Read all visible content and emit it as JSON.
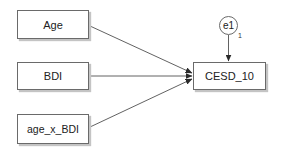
{
  "diagram": {
    "type": "path-diagram",
    "observed_variables": {
      "age": {
        "label": "Age"
      },
      "bdi": {
        "label": "BDI"
      },
      "age_x_bdi": {
        "label": "age_x_BDI"
      },
      "cesd": {
        "label": "CESD_10"
      }
    },
    "error_terms": {
      "e1": {
        "label": "e1",
        "weight": "1"
      }
    },
    "paths": [
      {
        "from": "Age",
        "to": "CESD_10"
      },
      {
        "from": "BDI",
        "to": "CESD_10"
      },
      {
        "from": "age_x_BDI",
        "to": "CESD_10"
      },
      {
        "from": "e1",
        "to": "CESD_10"
      }
    ],
    "colors": {
      "line": "#3a3a3a",
      "border": "#6a6a6a",
      "shadow": "#c4c4c4",
      "background": "#ffffff"
    }
  }
}
